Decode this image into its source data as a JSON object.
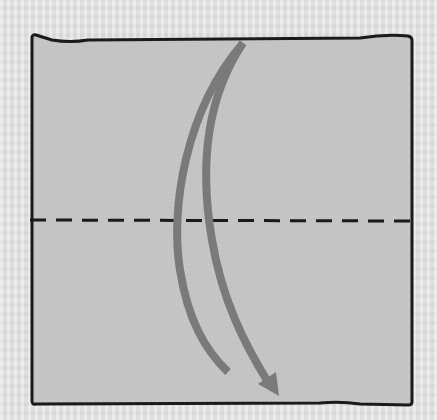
{
  "diagram": {
    "paper": {
      "fill": "#c4c4c4",
      "outline": "#1a1a1a",
      "corners": {
        "top_left": [
          32,
          35
        ],
        "top_right": [
          412,
          38
        ],
        "bottom_right": [
          412,
          405
        ],
        "bottom_left": [
          32,
          404
        ]
      }
    },
    "fold_line": {
      "style": "dashed",
      "color": "#1a1a1a",
      "y": 220,
      "x_start": 30,
      "x_end": 410
    },
    "arrows": [
      {
        "name": "fold-arrow-left-arc",
        "color": "#7a7a7a",
        "start": [
          243,
          43
        ],
        "through": [
          178,
          220
        ],
        "end": [
          228,
          372
        ],
        "arrowhead": false
      },
      {
        "name": "fold-arrow-right-arc",
        "color": "#7a7a7a",
        "start": [
          243,
          43
        ],
        "through": [
          210,
          220
        ],
        "end": [
          278,
          395
        ],
        "arrowhead": true
      }
    ],
    "background_color": "#e2e2e2"
  }
}
